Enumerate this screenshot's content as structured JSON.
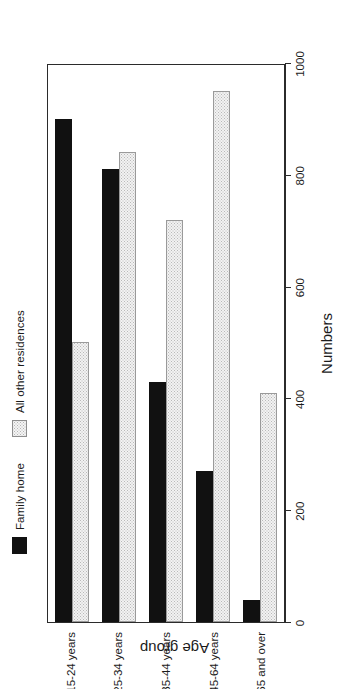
{
  "chart_data": {
    "type": "bar",
    "orientation": "horizontal",
    "title": "",
    "xlabel": "Numbers",
    "ylabel": "Age group",
    "categories": [
      "15-24 years",
      "25-34 years",
      "35-44 years",
      "45-64 years",
      "65 and over"
    ],
    "series": [
      {
        "name": "Family home",
        "color": "#111111",
        "values": [
          900,
          810,
          430,
          270,
          40
        ]
      },
      {
        "name": "All other residences",
        "color": "#f2f2f2",
        "values": [
          500,
          840,
          720,
          950,
          410
        ]
      }
    ],
    "xlim": [
      0,
      1000
    ],
    "xticks": [
      0,
      200,
      400,
      600,
      800,
      1000
    ],
    "xtick_labels": [
      "0",
      "200",
      "400",
      "600",
      "800",
      "1000"
    ],
    "grid": false,
    "legend_position": "top",
    "frame": true
  },
  "legend": {
    "entries": [
      {
        "label": "Family home",
        "swatch": "solid-black-swatch"
      },
      {
        "label": "All other residences",
        "swatch": "stippled-grey-swatch"
      }
    ]
  },
  "axes": {
    "value_axis_title": "Numbers",
    "category_axis_title": "Age group"
  }
}
